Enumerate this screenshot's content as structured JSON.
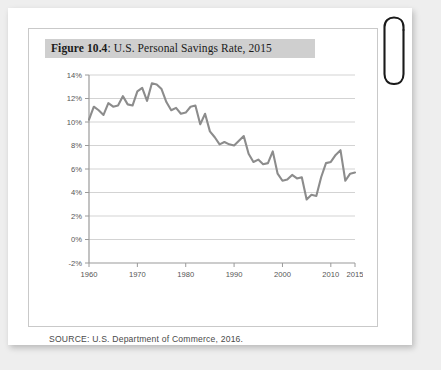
{
  "page": {
    "background_color": "#eeeeee",
    "card_color": "#ffffff"
  },
  "figure": {
    "number_label": "Figure 10.4",
    "title_separator": ": ",
    "title_text": "U.S. Personal Savings Rate, 2015",
    "banner_color": "#cfcfcf",
    "source_note": "SOURCE: U.S. Department of Commerce, 2016."
  },
  "decoration": {
    "paperclip_label": "paperclip",
    "paperclip_color": "#1a1a1a"
  },
  "chart_data": {
    "type": "line",
    "title": "U.S. Personal Savings Rate, 2015",
    "xlabel": "",
    "ylabel": "",
    "xlim": [
      1960,
      2015
    ],
    "ylim": [
      -2,
      14
    ],
    "grid": true,
    "legend": "none",
    "line_color": "#8c8c8c",
    "axis_color": "#9a9a9a",
    "grid_color": "#c8c8c8",
    "ytick_labels": [
      "14%",
      "12%",
      "10%",
      "8%",
      "6%",
      "4%",
      "2%",
      "0%",
      "-2%"
    ],
    "ytick_values": [
      14,
      12,
      10,
      8,
      6,
      4,
      2,
      0,
      -2
    ],
    "xtick_labels": [
      "1960",
      "1970",
      "1980",
      "1990",
      "2000",
      "2010",
      "2015"
    ],
    "xtick_values": [
      1960,
      1970,
      1980,
      1990,
      2000,
      2010,
      2015
    ],
    "series": [
      {
        "name": "Personal Savings Rate",
        "x": [
          1960,
          1961,
          1962,
          1963,
          1964,
          1965,
          1966,
          1967,
          1968,
          1969,
          1970,
          1971,
          1972,
          1973,
          1974,
          1975,
          1976,
          1977,
          1978,
          1979,
          1980,
          1981,
          1982,
          1983,
          1984,
          1985,
          1986,
          1987,
          1988,
          1989,
          1990,
          1991,
          1992,
          1993,
          1994,
          1995,
          1996,
          1997,
          1998,
          1999,
          2000,
          2001,
          2002,
          2003,
          2004,
          2005,
          2006,
          2007,
          2008,
          2009,
          2010,
          2011,
          2012,
          2013,
          2014,
          2015
        ],
        "values": [
          10.2,
          11.3,
          11.0,
          10.6,
          11.6,
          11.3,
          11.4,
          12.2,
          11.5,
          11.4,
          12.6,
          12.9,
          11.8,
          13.3,
          13.2,
          12.8,
          11.7,
          11.0,
          11.2,
          10.7,
          10.8,
          11.3,
          11.4,
          9.8,
          10.7,
          9.2,
          8.7,
          8.1,
          8.3,
          8.1,
          8.0,
          8.4,
          8.8,
          7.3,
          6.6,
          6.8,
          6.4,
          6.5,
          7.5,
          5.6,
          5.0,
          5.1,
          5.5,
          5.2,
          5.3,
          3.4,
          3.8,
          3.7,
          5.3,
          6.5,
          6.6,
          7.2,
          7.6,
          5.0,
          5.6,
          5.7
        ]
      }
    ]
  }
}
